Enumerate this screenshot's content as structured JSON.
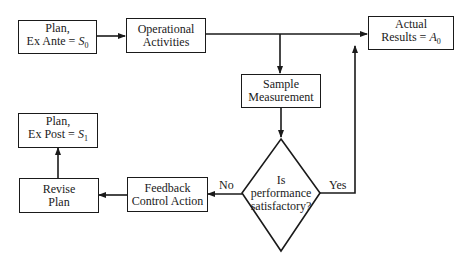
{
  "diagram": {
    "type": "flowchart",
    "nodes": {
      "plan_ex_ante": {
        "line1": "Plan,",
        "line2": "Ex Ante = ",
        "var": "S",
        "sub": "0"
      },
      "operational_activities": {
        "line1": "Operational",
        "line2": "Activities"
      },
      "actual_results": {
        "line1": "Actual",
        "line2": "Results = ",
        "var": "A",
        "sub": "0"
      },
      "sample_measurement": {
        "line1": "Sample",
        "line2": "Measurement"
      },
      "decision": {
        "line1": "Is",
        "line2": "performance",
        "line3": "satisfactory?"
      },
      "feedback_control": {
        "line1": "Feedback",
        "line2": "Control Action"
      },
      "revise_plan": {
        "line1": "Revise",
        "line2": "Plan"
      },
      "plan_ex_post": {
        "line1": "Plan,",
        "line2": "Ex Post = ",
        "var": "S",
        "sub": "1"
      }
    },
    "edge_labels": {
      "no": "No",
      "yes": "Yes"
    },
    "edges": [
      {
        "from": "plan_ex_ante",
        "to": "operational_activities"
      },
      {
        "from": "operational_activities",
        "to": "actual_results"
      },
      {
        "from": "operational_activities",
        "to": "sample_measurement"
      },
      {
        "from": "sample_measurement",
        "to": "decision"
      },
      {
        "from": "decision",
        "to": "actual_results",
        "label": "Yes"
      },
      {
        "from": "decision",
        "to": "feedback_control",
        "label": "No"
      },
      {
        "from": "feedback_control",
        "to": "revise_plan"
      },
      {
        "from": "revise_plan",
        "to": "plan_ex_post"
      }
    ]
  }
}
